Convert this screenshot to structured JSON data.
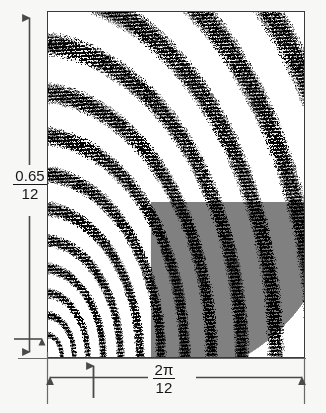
{
  "figure": {
    "type": "resonance-band-diagram",
    "background_color": "#f7f7f5",
    "plot_background_color": "#ffffff",
    "band_color": "#000000",
    "gap_color": "#ffffff",
    "shaded_region_color": "#808080",
    "frame_color": "#3a3a3a",
    "arrow_color": "#4a4a4a"
  },
  "axes": {
    "y": {
      "label_numerator": "0.65",
      "label_denominator": "12",
      "arrow_top": "up-arrow",
      "arrow_bottom": "down-arrow"
    },
    "x": {
      "label_numerator": "2π",
      "label_denominator": "12",
      "arrow_left": "left-arrow",
      "arrow_right": "right-arrow"
    }
  },
  "markers": {
    "x_tick_arrow": {
      "name": "up-arrow-marker",
      "position_fraction": 0.18
    },
    "y_tick_arrow": {
      "name": "right-arrow-marker",
      "position_fraction": 0.97
    }
  },
  "chart_data": {
    "type": "area",
    "title": "",
    "xlabel": "2π/12",
    "ylabel": "0.65/12",
    "xlim": [
      0,
      0.5235987756
    ],
    "ylim": [
      0,
      0.0541666667
    ],
    "grid": false,
    "legend": null,
    "bands": [
      {
        "index": 1,
        "radius": 0.055,
        "thickness": 0.02,
        "fill": "#000000",
        "noisy": true
      },
      {
        "index": 2,
        "radius": 0.105,
        "thickness": 0.024,
        "fill": "#000000",
        "noisy": true
      },
      {
        "index": 3,
        "radius": 0.16,
        "thickness": 0.028,
        "fill": "#000000",
        "noisy": true
      },
      {
        "index": 4,
        "radius": 0.222,
        "thickness": 0.032,
        "fill": "#000000",
        "noisy": true
      },
      {
        "index": 5,
        "radius": 0.292,
        "thickness": 0.036,
        "fill": "#000000",
        "noisy": true
      },
      {
        "index": 6,
        "radius": 0.37,
        "thickness": 0.04,
        "fill": "#000000",
        "noisy": true
      },
      {
        "index": 7,
        "radius": 0.456,
        "thickness": 0.045,
        "fill": "#000000",
        "noisy": true
      },
      {
        "index": 8,
        "radius": 0.552,
        "thickness": 0.05,
        "fill": "#000000",
        "noisy": true
      },
      {
        "index": 9,
        "radius": 0.66,
        "thickness": 0.056,
        "fill": "#000000",
        "noisy": true
      },
      {
        "index": 10,
        "radius": 0.782,
        "thickness": 0.063,
        "fill": "#000000",
        "noisy": true
      },
      {
        "index": 11,
        "radius": 0.92,
        "thickness": 0.072,
        "fill": "#000000",
        "noisy": true
      },
      {
        "index": 12,
        "radius": 1.078,
        "thickness": 0.082,
        "fill": "#000000",
        "noisy": true
      },
      {
        "index": 13,
        "radius": 1.262,
        "thickness": 0.095,
        "fill": "#000000",
        "noisy": true
      },
      {
        "index": 14,
        "radius": 1.48,
        "thickness": 0.112,
        "fill": "#000000",
        "noisy": true
      },
      {
        "index": 15,
        "radius": 1.745,
        "thickness": 0.135,
        "fill": "#000000",
        "noisy": true
      }
    ],
    "shaded_region": {
      "fill": "#808080",
      "x_range_fraction": [
        0.45,
        1.0
      ],
      "y_range_fraction": [
        0.62,
        1.0
      ]
    }
  }
}
